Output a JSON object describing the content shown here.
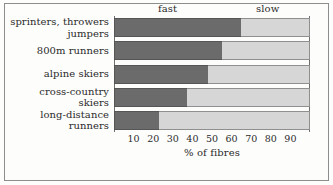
{
  "chart_data": {
    "type": "bar",
    "orientation": "horizontal",
    "stacked": true,
    "title": "",
    "xlabel": "% of fibres",
    "ylabel": "",
    "xlim": [
      0,
      100
    ],
    "xticks": [
      10,
      20,
      30,
      40,
      50,
      60,
      70,
      80,
      90
    ],
    "grid": false,
    "legend_position": "top",
    "legend": [
      "fast",
      "slow"
    ],
    "categories": [
      "sprinters, throwers\njumpers",
      "800m runners",
      "alpine skiers",
      "cross-country\nskiers",
      "long-distance\nrunners"
    ],
    "series": [
      {
        "name": "fast",
        "values": [
          65,
          55,
          48,
          37,
          23
        ],
        "color": "#6b6b6b"
      },
      {
        "name": "slow",
        "values": [
          35,
          45,
          52,
          63,
          77
        ],
        "color": "#d6d6d6"
      }
    ]
  },
  "legend": {
    "fast": "fast",
    "slow": "slow"
  },
  "axis": {
    "title": "% of fibres",
    "ticks": [
      "10",
      "20",
      "30",
      "40",
      "50",
      "60",
      "70",
      "80",
      "90"
    ]
  },
  "categories": [
    "sprinters, throwers\njumpers",
    "800m runners",
    "alpine skiers",
    "cross-country\nskiers",
    "long-distance\nrunners"
  ]
}
